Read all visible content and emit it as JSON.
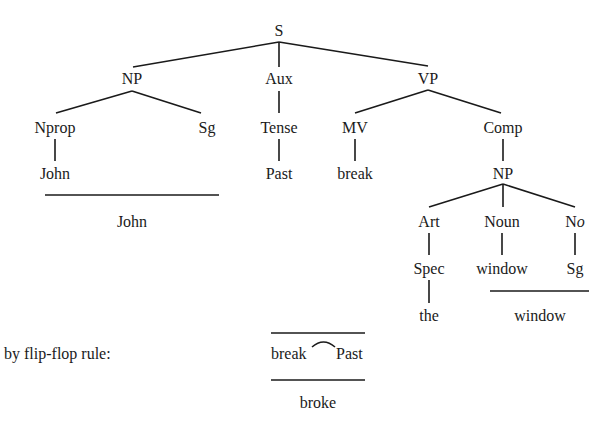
{
  "tree": {
    "root": {
      "id": "S",
      "label": "S"
    },
    "nodes": [
      {
        "id": "S",
        "label": "S",
        "x": 279,
        "y": 36
      },
      {
        "id": "NP1",
        "label": "NP",
        "x": 132,
        "y": 84
      },
      {
        "id": "Aux",
        "label": "Aux",
        "x": 279,
        "y": 84
      },
      {
        "id": "VP",
        "label": "VP",
        "x": 428,
        "y": 84
      },
      {
        "id": "Nprop",
        "label": "Nprop",
        "x": 55,
        "y": 133
      },
      {
        "id": "Sg1",
        "label": "Sg",
        "x": 207,
        "y": 133
      },
      {
        "id": "Tense",
        "label": "Tense",
        "x": 279,
        "y": 133
      },
      {
        "id": "MV",
        "label": "MV",
        "x": 355,
        "y": 133
      },
      {
        "id": "Comp",
        "label": "Comp",
        "x": 503,
        "y": 133
      },
      {
        "id": "John",
        "label": "John",
        "x": 55,
        "y": 179
      },
      {
        "id": "Past",
        "label": "Past",
        "x": 279,
        "y": 179
      },
      {
        "id": "break",
        "label": "break",
        "x": 355,
        "y": 179
      },
      {
        "id": "NP2",
        "label": "NP",
        "x": 503,
        "y": 179
      },
      {
        "id": "Art",
        "label": "Art",
        "x": 429,
        "y": 227
      },
      {
        "id": "Noun",
        "label": "Noun",
        "x": 502,
        "y": 227
      },
      {
        "id": "No",
        "label": "No",
        "x": 575,
        "y": 227
      },
      {
        "id": "Spec",
        "label": "Spec",
        "x": 429,
        "y": 274
      },
      {
        "id": "window",
        "label": "window",
        "x": 502,
        "y": 274
      },
      {
        "id": "Sg2",
        "label": "Sg",
        "x": 575,
        "y": 274
      },
      {
        "id": "the",
        "label": "the",
        "x": 429,
        "y": 321
      }
    ],
    "edges": [
      {
        "from": "S",
        "to": "NP1",
        "x1": 279,
        "y1": 42,
        "x2": 133,
        "y2": 67
      },
      {
        "from": "S",
        "to": "Aux",
        "x1": 279,
        "y1": 42,
        "x2": 279,
        "y2": 67
      },
      {
        "from": "S",
        "to": "VP",
        "x1": 279,
        "y1": 42,
        "x2": 428,
        "y2": 66
      },
      {
        "from": "NP1",
        "to": "Nprop",
        "x1": 132,
        "y1": 91,
        "x2": 56,
        "y2": 113
      },
      {
        "from": "NP1",
        "to": "Sg1",
        "x1": 132,
        "y1": 91,
        "x2": 201,
        "y2": 113
      },
      {
        "from": "Aux",
        "to": "Tense",
        "x1": 279,
        "y1": 91,
        "x2": 279,
        "y2": 113
      },
      {
        "from": "VP",
        "to": "MV",
        "x1": 428,
        "y1": 90,
        "x2": 355,
        "y2": 113
      },
      {
        "from": "VP",
        "to": "Comp",
        "x1": 428,
        "y1": 90,
        "x2": 501,
        "y2": 113
      },
      {
        "from": "Nprop",
        "to": "John",
        "x1": 55,
        "y1": 139,
        "x2": 55,
        "y2": 161
      },
      {
        "from": "Tense",
        "to": "Past",
        "x1": 279,
        "y1": 139,
        "x2": 279,
        "y2": 161
      },
      {
        "from": "MV",
        "to": "break",
        "x1": 355,
        "y1": 139,
        "x2": 355,
        "y2": 161
      },
      {
        "from": "Comp",
        "to": "NP2",
        "x1": 503,
        "y1": 139,
        "x2": 503,
        "y2": 161
      },
      {
        "from": "NP2",
        "to": "Art",
        "x1": 503,
        "y1": 184,
        "x2": 429,
        "y2": 207
      },
      {
        "from": "NP2",
        "to": "Noun",
        "x1": 503,
        "y1": 184,
        "x2": 503,
        "y2": 207
      },
      {
        "from": "NP2",
        "to": "No",
        "x1": 503,
        "y1": 184,
        "x2": 575,
        "y2": 207
      },
      {
        "from": "Art",
        "to": "Spec",
        "x1": 429,
        "y1": 233,
        "x2": 429,
        "y2": 255
      },
      {
        "from": "Noun",
        "to": "window",
        "x1": 502,
        "y1": 233,
        "x2": 502,
        "y2": 255
      },
      {
        "from": "No",
        "to": "Sg2",
        "x1": 575,
        "y1": 233,
        "x2": 575,
        "y2": 255
      },
      {
        "from": "Spec",
        "to": "the",
        "x1": 429,
        "y1": 280,
        "x2": 429,
        "y2": 303
      }
    ]
  },
  "morphology": {
    "john_underline": {
      "x1": 45,
      "x2": 219,
      "y": 195
    },
    "john_result": {
      "label": "John",
      "x": 132,
      "y": 227
    },
    "window_underline": {
      "x1": 490,
      "x2": 589,
      "y": 291
    },
    "window_result": {
      "label": "window",
      "x": 540,
      "y": 321
    }
  },
  "flip_flop": {
    "rule_label": "by flip-flop rule:",
    "rule_label_pos": {
      "x": 4,
      "y": 359
    },
    "top_line": {
      "x1": 271,
      "x2": 365,
      "y": 333
    },
    "input_word_1": "break",
    "input_word_2": "Past",
    "input_pos_1": {
      "x": 271,
      "y": 359
    },
    "input_pos_2": {
      "x": 336,
      "y": 359
    },
    "arc": {
      "x1": 312,
      "x2": 335,
      "y": 343
    },
    "bottom_line": {
      "x1": 271,
      "x2": 365,
      "y": 380
    },
    "output_word": "broke",
    "output_pos": {
      "x": 318,
      "y": 408
    }
  }
}
